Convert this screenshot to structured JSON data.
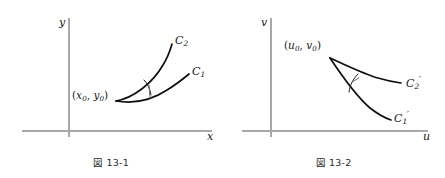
{
  "figure": {
    "kind": "mathematical-diagram",
    "background_color": "#ffffff",
    "axis_color": "#a8a8a8",
    "curve_color": "#0f0f0f"
  },
  "panels": [
    {
      "id": "panel-left",
      "caption": "図 13-1",
      "axes": {
        "vertical_label": "y",
        "horizontal_label": "x"
      },
      "point": {
        "label_open": "(",
        "var1": "x",
        "sub1": "0",
        "separator": ", ",
        "var2": "y",
        "sub2": "0",
        "label_close": ")",
        "full_text": "(x0, y0)"
      },
      "curves": [
        {
          "id": "C1",
          "name": "C",
          "subscript": "1",
          "prime": "",
          "position": "lower"
        },
        {
          "id": "C2",
          "name": "C",
          "subscript": "2",
          "prime": "",
          "position": "upper"
        }
      ],
      "angle_marker": "arc-with-tick"
    },
    {
      "id": "panel-right",
      "caption": "図 13-2",
      "axes": {
        "vertical_label": "v",
        "horizontal_label": "u"
      },
      "point": {
        "label_open": "(",
        "var1": "u",
        "sub1": "0",
        "separator": ", ",
        "var2": "v",
        "sub2": "0",
        "label_close": ")",
        "full_text": "(u0, v0)"
      },
      "curves": [
        {
          "id": "C1p",
          "name": "C",
          "subscript": "1",
          "prime": "′",
          "position": "lower"
        },
        {
          "id": "C2p",
          "name": "C",
          "subscript": "2",
          "prime": "′",
          "position": "upper"
        }
      ],
      "angle_marker": "arc-with-tick"
    }
  ]
}
